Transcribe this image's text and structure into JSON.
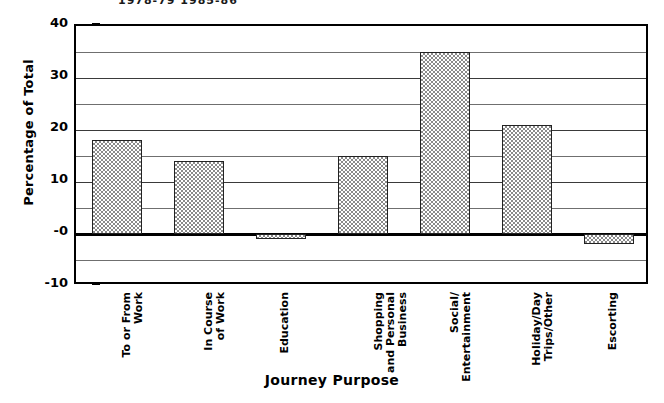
{
  "clipped_header": "1978-79   1985-86",
  "chart_data": {
    "type": "bar",
    "title": "",
    "xlabel": "Journey Purpose",
    "ylabel": "Percentage of Total",
    "categories": [
      "To or From\nWork",
      "In Course\nof Work",
      "Education",
      "Shopping\nand Personal\nBusiness",
      "Social/\nEntertainment",
      "Holiday/Day\nTrips/Other",
      "Escorting"
    ],
    "values": [
      18,
      14,
      -1,
      15,
      35,
      21,
      -2
    ],
    "ylim": [
      -10,
      40
    ],
    "ytick_labels": [
      "40",
      "30",
      "20",
      "10",
      "-0",
      "-10"
    ],
    "ytick_values": [
      40,
      30,
      20,
      10,
      0,
      -10
    ],
    "gridlines": [
      35,
      30,
      25,
      20,
      15,
      10,
      5,
      -5
    ],
    "grid": true,
    "legend": "none",
    "bar_fill": "#cfcfcf",
    "bar_pattern": "checkered-halftone",
    "bar_border": "#222222",
    "axis_color": "#000000"
  },
  "xaxis": {
    "labels": [
      [
        "To or From",
        "Work"
      ],
      [
        "In Course",
        "of Work"
      ],
      [
        "Education"
      ],
      [
        "Shopping",
        "and Personal",
        "Business"
      ],
      [
        "Social/",
        "Entertainment"
      ],
      [
        "Holiday/Day",
        "Trips/Other"
      ],
      [
        "Escorting"
      ]
    ]
  }
}
